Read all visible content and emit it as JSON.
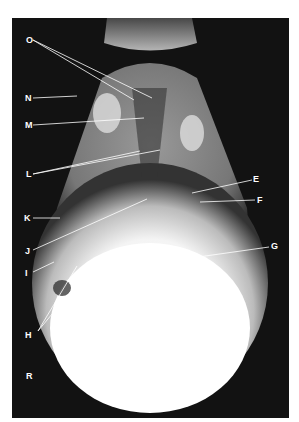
{
  "figure": {
    "side_marker": "R",
    "labels": [
      {
        "id": "O",
        "x": 26,
        "y": 22
      },
      {
        "id": "N",
        "x": 26,
        "y": 81
      },
      {
        "id": "M",
        "x": 26,
        "y": 107
      },
      {
        "id": "L",
        "x": 26,
        "y": 157
      },
      {
        "id": "E",
        "x": 241,
        "y": 161
      },
      {
        "id": "F",
        "x": 244,
        "y": 183
      },
      {
        "id": "K",
        "x": 24,
        "y": 200
      },
      {
        "id": "J",
        "x": 24,
        "y": 233
      },
      {
        "id": "G",
        "x": 258,
        "y": 227
      },
      {
        "id": "I",
        "x": 24,
        "y": 253
      },
      {
        "id": "H",
        "x": 24,
        "y": 315
      },
      {
        "id": "R",
        "x": 26,
        "y": 356
      }
    ]
  }
}
